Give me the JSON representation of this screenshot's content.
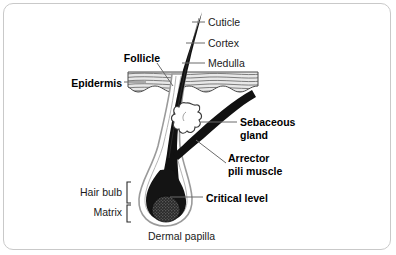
{
  "figure": {
    "border_color": "#c9c9c9",
    "background": "#ffffff",
    "ink_color": "#1b1b1b"
  },
  "labels": {
    "cuticle": "Cuticle",
    "cortex": "Cortex",
    "medulla": "Medulla",
    "follicle": "Follicle",
    "epidermis": "Epidermis",
    "sebaceous_line1": "Sebaceous",
    "sebaceous_line2": "gland",
    "arrector_line1": "Arrector",
    "arrector_line2": "pili muscle",
    "hair_bulb": "Hair bulb",
    "matrix": "Matrix",
    "critical_level": "Critical level",
    "dermal_papilla": "Dermal papilla"
  },
  "parts": [
    {
      "name": "hair-shaft",
      "style": "solid black tapering spike"
    },
    {
      "name": "epidermis-band",
      "style": "grey wavy stacked lines"
    },
    {
      "name": "follicle-sheath",
      "style": "white channel with grey outline"
    },
    {
      "name": "sebaceous-gland",
      "style": "white lobed scalloped sac"
    },
    {
      "name": "arrector-pili-muscle",
      "style": "thick black diagonal band"
    },
    {
      "name": "hair-bulb",
      "style": "rounded black bulb with grey outline"
    },
    {
      "name": "dermal-papilla",
      "style": "stippled dark nub"
    }
  ]
}
